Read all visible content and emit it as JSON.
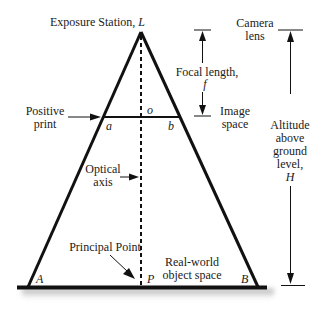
{
  "diagram": {
    "labels": {
      "exposure_station": "Exposure Station, ",
      "exposure_station_symbol": "L",
      "camera_lens_1": "Camera",
      "camera_lens_2": "lens",
      "focal_length_1": "Focal length,",
      "focal_length_symbol": "f",
      "image_space_1": "Image",
      "image_space_2": "space",
      "positive_print_1": "Positive",
      "positive_print_2": "print",
      "point_o": "o",
      "point_a": "a",
      "point_b": "b",
      "optical_axis_1": "Optical",
      "optical_axis_2": "axis",
      "altitude_1": "Altitude",
      "altitude_2": "above",
      "altitude_3": "ground",
      "altitude_4": "level,",
      "altitude_symbol": "H",
      "principal_point": "Principal Point",
      "real_world_1": "Real-world",
      "real_world_2": "object space",
      "point_A": "A",
      "point_P": "P",
      "point_B": "B"
    },
    "colors": {
      "line": "#111111",
      "text": "#1a1a1a",
      "shadow": "#9a9a9a"
    }
  }
}
